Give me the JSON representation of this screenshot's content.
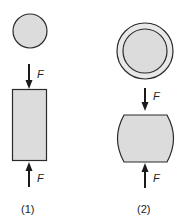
{
  "figure": {
    "colors": {
      "fill": "#dcdcdc",
      "stroke": "#2a2a2a",
      "arrow": "#1a1a1a"
    },
    "specimens": [
      {
        "id": "1",
        "caption": "(1)",
        "top_view": "circle",
        "side_view": "cylinder (undeformed)",
        "force_top_label": "F",
        "force_bottom_label": "F"
      },
      {
        "id": "2",
        "caption": "(2)",
        "top_view": "circle with outer ring",
        "side_view": "barreled cylinder (deformed)",
        "force_top_label": "F",
        "force_bottom_label": "F"
      }
    ]
  }
}
